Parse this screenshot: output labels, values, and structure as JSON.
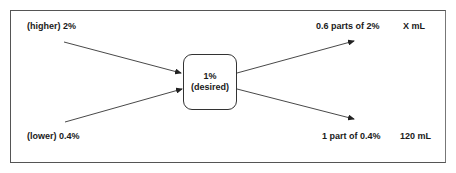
{
  "diagram": {
    "type": "alligation",
    "nodes": {
      "higher": {
        "label": "(higher) 2%"
      },
      "lower": {
        "label": "(lower) 0.4%"
      },
      "desired": {
        "line1": "1%",
        "line2": "(desired)"
      },
      "higher_parts": {
        "label": "0.6 parts of 2%",
        "volume": "X mL"
      },
      "lower_parts": {
        "label": "1 part of 0.4%",
        "volume": "120 mL"
      }
    },
    "edges": [
      {
        "from": "higher",
        "to": "desired"
      },
      {
        "from": "lower",
        "to": "desired"
      },
      {
        "from": "desired",
        "to": "higher_parts"
      },
      {
        "from": "desired",
        "to": "lower_parts"
      }
    ],
    "colors": {
      "stroke": "#333333",
      "text": "#1a1a1a",
      "frame": "#555555"
    }
  }
}
